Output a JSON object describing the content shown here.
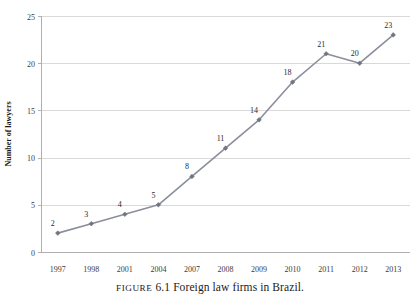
{
  "chart_data": {
    "type": "line",
    "title": "",
    "xlabel": "",
    "ylabel": "Number of lawyers",
    "categories": [
      "1997",
      "1998",
      "2001",
      "2004",
      "2007",
      "2008",
      "2009",
      "2010",
      "2011",
      "2012",
      "2013"
    ],
    "values": [
      2,
      3,
      4,
      5,
      8,
      11,
      14,
      18,
      21,
      20,
      23
    ],
    "point_labels": [
      "2",
      "3",
      "4",
      "5",
      "8",
      "11",
      "14",
      "18",
      "21",
      "20",
      "23"
    ],
    "ylim": [
      0,
      25
    ],
    "yticks": [
      0,
      5,
      10,
      15,
      20,
      25
    ],
    "ytick_labels": [
      "0",
      "5",
      "10",
      "15",
      "20",
      "25"
    ],
    "grid": true,
    "grid_axis": "y",
    "legend": "none",
    "series_color": "#8b8f9c",
    "marker_color": "#71757f",
    "grid_color": "#d9d9d9",
    "axis_color": "#b0b0b0"
  },
  "caption": {
    "figure_word": "Figure",
    "figure_number": "6.1",
    "figure_text": "Foreign law firms in Brazil.",
    "full": "Figure 6.1 Foreign law firms in Brazil."
  }
}
